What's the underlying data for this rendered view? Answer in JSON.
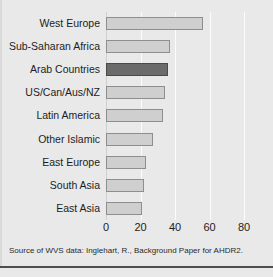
{
  "chart_data": {
    "type": "bar",
    "orientation": "horizontal",
    "title": "",
    "xlabel": "",
    "ylabel": "",
    "xlim": [
      0,
      84
    ],
    "xticks": [
      0,
      20,
      40,
      60,
      80
    ],
    "xtick_labels": [
      "0",
      "20",
      "40",
      "60",
      "80"
    ],
    "grid": true,
    "legend": "none",
    "categories": [
      "West Europe",
      "Sub-Saharan Africa",
      "Arab Countries",
      "US/Can/Aus/NZ",
      "Latin America",
      "Other Islamic",
      "East Europe",
      "South Asia",
      "East Asia"
    ],
    "values": [
      56,
      37,
      36,
      34,
      33,
      27,
      23,
      22,
      21
    ],
    "highlight_category": "Arab Countries",
    "colors": {
      "bar_fill": "#cfcfcf",
      "bar_border": "#8e8e8e",
      "highlight_fill": "#6b6b6b",
      "highlight_border": "#4a4a4a",
      "background": "#e9e9e9",
      "gridline": "#fcfcfc"
    }
  },
  "source": {
    "text": "Source of WVS data: Inglehart, R., Background Paper for AHDR2."
  }
}
